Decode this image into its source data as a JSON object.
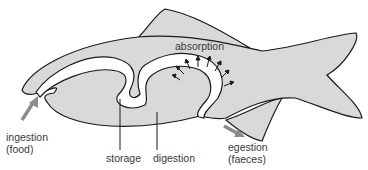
{
  "diagram": {
    "labels": {
      "absorption": "absorption",
      "ingestion_line1": "ingestion",
      "ingestion_line2": "(food)",
      "storage": "storage",
      "digestion": "digestion",
      "egestion_line1": "egestion",
      "egestion_line2": "(faeces)"
    },
    "colors": {
      "body_fill": "#d9d9d9",
      "outline": "#1a1a1a",
      "gut_fill": "#ffffff",
      "flow_arrow": "#8c8c8c",
      "text": "#3a3a3a"
    }
  }
}
